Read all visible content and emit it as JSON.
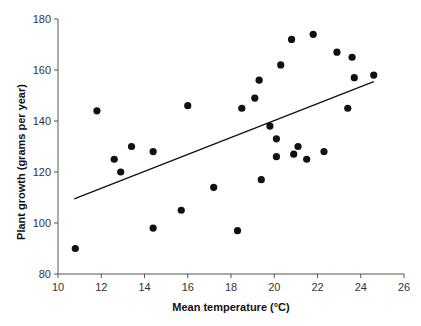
{
  "chart_data": {
    "type": "scatter",
    "title": "",
    "xlabel": "Mean temperature (°C)",
    "ylabel": "Plant growth (grams per year)",
    "xlim": [
      10,
      26
    ],
    "ylim": [
      80,
      180
    ],
    "xticks": [
      10,
      12,
      14,
      16,
      18,
      20,
      22,
      24,
      26
    ],
    "yticks": [
      80,
      100,
      120,
      140,
      160,
      180
    ],
    "grid": false,
    "legend": null,
    "series": [
      {
        "name": "observations",
        "marker": "filled-circle",
        "color": "#111111",
        "points": [
          {
            "x": 10.8,
            "y": 90
          },
          {
            "x": 11.8,
            "y": 144
          },
          {
            "x": 12.6,
            "y": 125
          },
          {
            "x": 12.9,
            "y": 120
          },
          {
            "x": 13.4,
            "y": 130
          },
          {
            "x": 14.4,
            "y": 128
          },
          {
            "x": 14.4,
            "y": 98
          },
          {
            "x": 15.7,
            "y": 105
          },
          {
            "x": 16.0,
            "y": 146
          },
          {
            "x": 17.2,
            "y": 114
          },
          {
            "x": 18.3,
            "y": 97
          },
          {
            "x": 18.5,
            "y": 145
          },
          {
            "x": 19.1,
            "y": 149
          },
          {
            "x": 19.3,
            "y": 156
          },
          {
            "x": 19.4,
            "y": 117
          },
          {
            "x": 19.8,
            "y": 138
          },
          {
            "x": 20.1,
            "y": 133
          },
          {
            "x": 20.1,
            "y": 126
          },
          {
            "x": 20.3,
            "y": 162
          },
          {
            "x": 20.8,
            "y": 172
          },
          {
            "x": 20.9,
            "y": 127
          },
          {
            "x": 21.1,
            "y": 130
          },
          {
            "x": 21.5,
            "y": 125
          },
          {
            "x": 21.8,
            "y": 174
          },
          {
            "x": 22.3,
            "y": 128
          },
          {
            "x": 22.9,
            "y": 167
          },
          {
            "x": 23.4,
            "y": 145
          },
          {
            "x": 23.6,
            "y": 165
          },
          {
            "x": 23.7,
            "y": 157
          },
          {
            "x": 24.6,
            "y": 158
          }
        ]
      },
      {
        "name": "linear-fit",
        "type": "line",
        "color": "#111111",
        "points": [
          {
            "x": 10.75,
            "y": 109.5
          },
          {
            "x": 24.6,
            "y": 155.4
          }
        ]
      }
    ]
  },
  "layout": {
    "x_px": [
      58,
      404
    ],
    "y_px": [
      274,
      19
    ]
  }
}
